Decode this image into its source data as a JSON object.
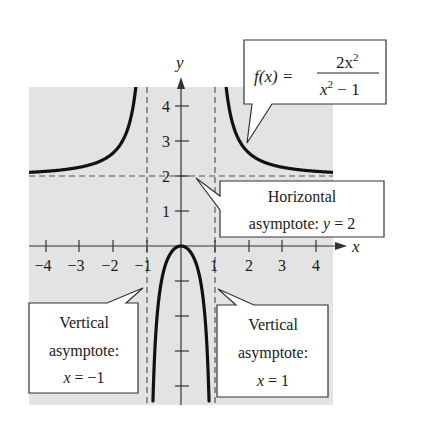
{
  "chart_data": {
    "type": "line",
    "title": "",
    "function": "f(x) = 2x^2 / (x^2 - 1)",
    "xlabel": "x",
    "ylabel": "y",
    "xlim": [
      -4.5,
      4.5
    ],
    "ylim": [
      -4.5,
      4.5
    ],
    "grid": false,
    "x_ticks": [
      -4,
      -3,
      -2,
      -1,
      1,
      2,
      3,
      4
    ],
    "x_tick_labels": [
      "−4",
      "−3",
      "−2",
      "−1",
      "1",
      "2",
      "3",
      "4"
    ],
    "y_ticks": [
      1,
      2,
      3,
      4,
      -1,
      -2,
      -3,
      -4
    ],
    "y_tick_labels": [
      "1",
      "2",
      "3",
      "4"
    ],
    "series": [
      {
        "name": "f(x) = 2x²/(x² − 1)",
        "branches": [
          {
            "x": [
              -4.5,
              -4,
              -3,
              -2,
              -1.5,
              -1.3,
              -1.2
            ],
            "y": [
              2.1,
              2.13,
              2.25,
              2.67,
              3.6,
              4.12,
              4.9
            ]
          },
          {
            "x": [
              -0.85,
              -0.8,
              -0.6,
              -0.4,
              -0.2,
              0,
              0.2,
              0.4,
              0.6,
              0.8,
              0.85
            ],
            "y": [
              -5.2,
              -3.56,
              -1.13,
              -0.38,
              -0.08,
              0,
              -0.08,
              -0.38,
              -1.13,
              -3.56,
              -5.2
            ]
          },
          {
            "x": [
              1.2,
              1.3,
              1.5,
              2,
              3,
              4,
              4.5
            ],
            "y": [
              4.9,
              4.12,
              3.6,
              2.67,
              2.25,
              2.13,
              2.1
            ]
          }
        ]
      }
    ],
    "asymptotes": {
      "horizontal": [
        2
      ],
      "vertical": [
        -1,
        1
      ]
    },
    "annotations": [
      {
        "id": "function",
        "text": "f(x) = 2x² / (x² − 1)",
        "points_to": [
          1.7,
          3.0
        ]
      },
      {
        "id": "horizontal",
        "lines": [
          "Horizontal",
          "asymptote: y = 2"
        ],
        "points_to": [
          0.1,
          1.95
        ]
      },
      {
        "id": "vertical-left",
        "lines": [
          "Vertical",
          "asymptote:",
          "x = −1"
        ],
        "points_to": [
          -1.1,
          -1.2
        ]
      },
      {
        "id": "vertical-right",
        "lines": [
          "Vertical",
          "asymptote:",
          "x = 1"
        ],
        "points_to": [
          1.1,
          -1.2
        ]
      }
    ]
  },
  "labels": {
    "x_axis": "x",
    "y_axis": "y",
    "y_tick_1": "1",
    "y_tick_2": "2",
    "y_tick_3": "3",
    "y_tick_4": "4",
    "x_tick_m4": "−4",
    "x_tick_m3": "−3",
    "x_tick_m2": "−2",
    "x_tick_m1": "−1",
    "x_tick_1": "1",
    "x_tick_2": "2",
    "x_tick_3": "3",
    "x_tick_4": "4"
  },
  "callouts": {
    "function": {
      "lhs": "f(x) =",
      "numerator": "2x",
      "numerator_exp": "2",
      "denominator": "x",
      "denominator_exp": "2",
      "denominator_rest": " − 1"
    },
    "horizontal": {
      "line1": "Horizontal",
      "line2_prefix": "asymptote: ",
      "line2_var": "y",
      "line2_suffix": " = 2"
    },
    "vertical_left": {
      "line1": "Vertical",
      "line2": "asymptote:",
      "line3_var": "x",
      "line3_suffix": " = −1"
    },
    "vertical_right": {
      "line1": "Vertical",
      "line2": "asymptote:",
      "line3_var": "x",
      "line3_suffix": " = 1"
    }
  },
  "colors": {
    "background": "#ffffff",
    "plot_area": "#e3e3e3",
    "curve": "#111111",
    "axis": "#333333",
    "asymptote": "#555555",
    "callout_border": "#333333",
    "callout_fill": "#ffffff"
  }
}
